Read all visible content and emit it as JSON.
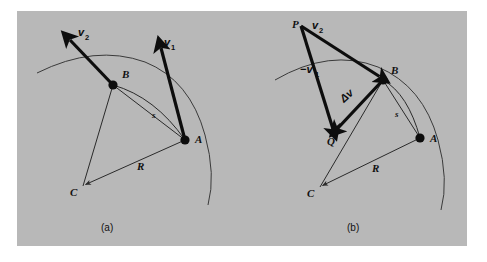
{
  "figure": {
    "background_color": "#ffffff",
    "panel_color": "#b8b8b8",
    "ink_color": "#0d0d0d",
    "caption_a": "(a)",
    "caption_b": "(b)"
  },
  "panel_a": {
    "caption": "(a)",
    "points": [
      {
        "name": "A",
        "label": "A",
        "x": 185,
        "y": 140,
        "marker": "filled-dot"
      },
      {
        "name": "B",
        "label": "B",
        "x": 113,
        "y": 85,
        "marker": "filled-dot"
      },
      {
        "name": "C",
        "label": "C",
        "x": 83,
        "y": 186,
        "marker": "arrow-vertex"
      }
    ],
    "labels": {
      "A": "A",
      "B": "B",
      "C": "C",
      "R": "R",
      "s": "s",
      "v1": "v",
      "v1_sub": "1",
      "v2": "v",
      "v2_sub": "2"
    },
    "segments": [
      {
        "name": "radius-CB",
        "from": "C",
        "to": "B",
        "style": "thin"
      },
      {
        "name": "radius-CA",
        "from": "C",
        "to": "A",
        "style": "thin",
        "label": "R"
      },
      {
        "name": "chord-BA",
        "from": "B",
        "to": "A",
        "style": "thin"
      },
      {
        "name": "arc-BA",
        "from": "B",
        "to": "A",
        "style": "thin-arc",
        "label": "s"
      }
    ],
    "vectors": [
      {
        "name": "v2-vector",
        "label": "v₂",
        "from": "B",
        "direction": "up-left",
        "style": "thick-arrow"
      },
      {
        "name": "v1-vector",
        "label": "v₁",
        "from": "A",
        "direction": "up-slightly-left",
        "style": "thick-arrow"
      }
    ]
  },
  "panel_b": {
    "caption": "(b)",
    "points": [
      {
        "name": "A",
        "label": "A",
        "x": 420,
        "y": 138,
        "marker": "filled-dot"
      },
      {
        "name": "B",
        "label": "B",
        "x": 383,
        "y": 80,
        "marker": "filled-dot"
      },
      {
        "name": "C",
        "label": "C",
        "x": 320,
        "y": 187,
        "marker": "arrow-vertex"
      },
      {
        "name": "P",
        "label": "P",
        "x": 301,
        "y": 26,
        "marker": "vertex"
      },
      {
        "name": "Q",
        "label": "Q",
        "x": 333,
        "y": 133,
        "marker": "vertex"
      }
    ],
    "labels": {
      "A": "A",
      "B": "B",
      "C": "C",
      "P": "P",
      "Q": "Q",
      "R": "R",
      "s": "s",
      "v2": "v",
      "v2_sub": "2",
      "neg_v1": "−v",
      "neg_v1_sub": "1",
      "delta_v": "Δv"
    },
    "segments": [
      {
        "name": "radius-CB",
        "from": "C",
        "to": "B",
        "style": "thin"
      },
      {
        "name": "radius-CA",
        "from": "C",
        "to": "A",
        "style": "thin",
        "label": "R"
      },
      {
        "name": "chord-BA",
        "from": "B",
        "to": "A",
        "style": "thin"
      },
      {
        "name": "arc-BA",
        "from": "B",
        "to": "A",
        "style": "thin-arc",
        "label": "s"
      }
    ],
    "vectors": [
      {
        "name": "v2-vector",
        "label": "v₂",
        "from": "P",
        "to": "B",
        "style": "thick-arrow"
      },
      {
        "name": "neg-v1-vector",
        "label": "−v₁",
        "from": "P",
        "to": "Q",
        "style": "thick-arrow"
      },
      {
        "name": "delta-v-vector",
        "label": "Δv",
        "from": "B",
        "to": "Q",
        "style": "thick-arrow"
      }
    ]
  }
}
